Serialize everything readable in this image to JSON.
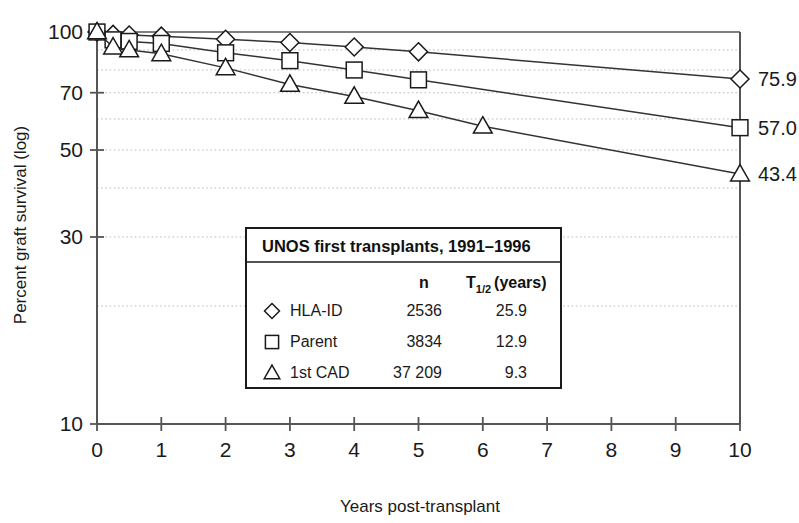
{
  "chart_data": {
    "type": "line",
    "title": "",
    "xlabel": "Years post-transplant",
    "ylabel": "Percent graft survival (log)",
    "xlim": [
      0,
      10
    ],
    "ylim": [
      10,
      100
    ],
    "yscale": "log",
    "grid": true,
    "x_ticks": [
      "0",
      "1",
      "2",
      "3",
      "4",
      "5",
      "6",
      "7",
      "8",
      "9",
      "10"
    ],
    "y_ticks": [
      "100",
      "70",
      "50",
      "30",
      "10"
    ],
    "gridline_values": [
      90,
      80,
      70,
      60,
      50,
      40,
      30,
      20
    ],
    "legend_position": "center",
    "series": [
      {
        "name": "HLA-ID",
        "marker": "diamond",
        "n": "2536",
        "half_life": "25.9",
        "endpoint_label": "75.9",
        "x": [
          0,
          0.25,
          0.5,
          1,
          2,
          3,
          4,
          5,
          10
        ],
        "values": [
          100,
          98.6,
          98.2,
          97.6,
          95.8,
          94.0,
          91.6,
          89.0,
          75.9
        ]
      },
      {
        "name": "Parent",
        "marker": "square",
        "n": "3834",
        "half_life": "12.9",
        "endpoint_label": "57.0",
        "x": [
          0,
          0.25,
          0.5,
          1,
          2,
          3,
          4,
          5,
          10
        ],
        "values": [
          100,
          95.5,
          94.6,
          93.5,
          88.5,
          84.5,
          80.0,
          75.5,
          57.0
        ]
      },
      {
        "name": "1st CAD",
        "marker": "triangle",
        "n": "37 209",
        "half_life": "9.3",
        "endpoint_label": "43.4",
        "x": [
          0,
          0.25,
          0.5,
          1,
          2,
          3,
          4,
          5,
          6,
          10
        ],
        "values": [
          100,
          91.5,
          90.0,
          88.0,
          81.0,
          73.5,
          68.5,
          63.0,
          57.5,
          43.4
        ]
      }
    ]
  },
  "legend": {
    "title": "UNOS first transplants, 1991–1996",
    "col_n": "n",
    "col_t_main": "T",
    "col_t_sub": "1/2",
    "col_t_unit": "(years)",
    "rows": [
      {
        "marker_name": "diamond-marker",
        "label": "HLA-ID",
        "n": "2536",
        "t_half": "25.9"
      },
      {
        "marker_name": "square-marker",
        "label": "Parent",
        "n": "3834",
        "t_half": "12.9"
      },
      {
        "marker_name": "triangle-marker",
        "label": "1st CAD",
        "n": "37 209",
        "t_half": "9.3"
      }
    ]
  },
  "colors": {
    "axis": "#555555",
    "line": "#333333",
    "grid": "#bbbbbb",
    "text": "#1a1a1a",
    "background": "#ffffff"
  }
}
